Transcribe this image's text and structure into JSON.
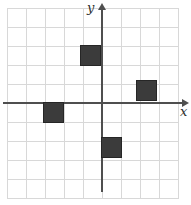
{
  "figure": {
    "background_color": "#ffffff",
    "grid": {
      "line_color": "#d8d8d8",
      "cell_px": 19,
      "columns": 9,
      "rows": 10,
      "left_px": 7,
      "top_px": 8,
      "width_px": 172,
      "height_px": 191
    },
    "axes": {
      "color": "#4f4f4f",
      "x_label": "x",
      "y_label": "y",
      "origin_px": {
        "x": 102,
        "y": 103
      },
      "x_axis": {
        "from_px": 3,
        "to_px": 189,
        "y_px": 102
      },
      "y_axis": {
        "from_px": 3,
        "to_px": 192,
        "x_px": 101
      }
    },
    "squares": {
      "fill_color": "#3b3b3b",
      "border_color": "#262626",
      "size_px": 21,
      "items": [
        {
          "name": "top-square",
          "grid_cell_x": "-1 to 0",
          "grid_cell_y": "2 to 3",
          "left": 80,
          "top": 45
        },
        {
          "name": "right-square",
          "grid_cell_x": "2 to 3",
          "grid_cell_y": "0 to 1",
          "left": 136,
          "top": 80
        },
        {
          "name": "left-square",
          "grid_cell_x": "-3 to -2",
          "grid_cell_y": "-1 to 0",
          "left": 43,
          "top": 102
        },
        {
          "name": "bottom-square",
          "grid_cell_x": "0 to 1",
          "grid_cell_y": "-3 to -2",
          "left": 101,
          "top": 137
        }
      ]
    }
  }
}
